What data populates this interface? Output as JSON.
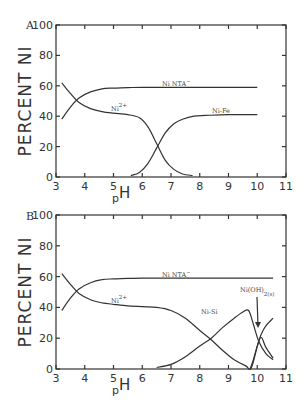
{
  "chart_data": [
    {
      "type": "line",
      "panel": "A",
      "title": "",
      "xlabel": "pH",
      "ylabel": "PERCENT NI",
      "xlim": [
        3,
        11
      ],
      "ylim": [
        0,
        100
      ],
      "xticks": [
        "3",
        "4",
        "5",
        "6",
        "7",
        "8",
        "9",
        "10",
        "11"
      ],
      "yticks": [
        "0",
        "20",
        "40",
        "60",
        "80",
        "100"
      ],
      "grid": false,
      "series": [
        {
          "name": "Ni NTA-",
          "x": [
            3.2,
            3.5,
            3.8,
            4.2,
            4.6,
            5,
            5.5,
            6,
            7,
            8,
            9,
            10
          ],
          "y": [
            38,
            46,
            52,
            56,
            58,
            58.5,
            58.8,
            59,
            59,
            59,
            59,
            59
          ]
        },
        {
          "name": "Ni2+",
          "x": [
            3.2,
            3.5,
            3.8,
            4.2,
            4.6,
            5,
            5.5,
            5.9,
            6.2,
            6.5,
            6.8,
            7.1,
            7.4,
            7.75
          ],
          "y": [
            62,
            55,
            49,
            45,
            43,
            42,
            41,
            39,
            33,
            22,
            11,
            5,
            2,
            1
          ]
        },
        {
          "name": "Ni-Fe",
          "x": [
            5.6,
            5.9,
            6.2,
            6.5,
            6.8,
            7.1,
            7.4,
            7.8,
            8.2,
            9,
            10
          ],
          "y": [
            1,
            3,
            9,
            19,
            29,
            35,
            38,
            40,
            40.5,
            41,
            41
          ]
        }
      ],
      "annotations": [
        {
          "text": "Ni NTA",
          "superscript": "-",
          "x": 7.2,
          "y": 62
        },
        {
          "text": "Ni",
          "superscript": "2+",
          "x": 5.0,
          "y": 43
        },
        {
          "text": "Ni-Fe",
          "x": 8.6,
          "y": 43
        }
      ]
    },
    {
      "type": "line",
      "panel": "B",
      "title": "",
      "xlabel": "pH",
      "ylabel": "PERCENT NI",
      "xlim": [
        3,
        11
      ],
      "ylim": [
        0,
        100
      ],
      "xticks": [
        "3",
        "4",
        "5",
        "6",
        "7",
        "8",
        "9",
        "10",
        "11"
      ],
      "yticks": [
        "0",
        "20",
        "40",
        "60",
        "80",
        "100"
      ],
      "grid": false,
      "series": [
        {
          "name": "Ni NTA-",
          "x": [
            3.2,
            3.5,
            3.8,
            4.2,
            4.6,
            5,
            5.5,
            6,
            7,
            8,
            9,
            10,
            10.55
          ],
          "y": [
            38,
            46,
            52,
            56,
            58,
            58.5,
            58.8,
            59,
            59,
            59,
            59,
            59,
            59
          ]
        },
        {
          "name": "Ni2+",
          "x": [
            3.2,
            3.5,
            3.8,
            4.2,
            4.6,
            5,
            5.5,
            6,
            6.5,
            7,
            7.5,
            8,
            8.4,
            8.8,
            9.2,
            9.6,
            9.8,
            10.1,
            10.3,
            10.55
          ],
          "y": [
            62,
            55,
            49,
            45,
            43,
            42,
            41,
            40.5,
            40,
            38,
            33,
            25,
            19,
            12,
            6,
            2,
            1,
            20,
            14,
            7
          ]
        },
        {
          "name": "Ni-Si",
          "x": [
            6.5,
            7,
            7.5,
            8,
            8.4,
            8.8,
            9.2,
            9.5,
            9.7,
            9.85,
            10.05,
            10.3,
            10.55
          ],
          "y": [
            1,
            3,
            8,
            15,
            20,
            27,
            33,
            37,
            38,
            30,
            18,
            10,
            6
          ]
        },
        {
          "name": "Ni(OH)2(s)",
          "x": [
            9.75,
            9.85,
            10.0,
            10.15,
            10.3,
            10.55
          ],
          "y": [
            0,
            5,
            15,
            23,
            28,
            33
          ]
        }
      ],
      "annotations": [
        {
          "text": "Ni NTA",
          "superscript": "-",
          "x": 7.2,
          "y": 62
        },
        {
          "text": "Ni",
          "superscript": "2+",
          "x": 5.0,
          "y": 42
        },
        {
          "text": "Ni-Si",
          "x": 8.3,
          "y": 37
        },
        {
          "text": "Ni(OH)",
          "subscript": "2(s)",
          "x": 9.8,
          "y": 50,
          "arrow_to": {
            "x": 10.2,
            "y": 26
          }
        }
      ]
    }
  ],
  "labels": {
    "panel_a": "A",
    "panel_b": "B",
    "ylabel": "PERCENT NI",
    "xlabel_p": "p",
    "xlabel_h": "H",
    "nta": "Ni NTA",
    "nta_sup": "−",
    "ni": "Ni",
    "ni_sup": "2+",
    "nife": "Ni-Fe",
    "nisi": "Ni-Si",
    "nioh": "Ni(OH)",
    "nioh_sub": "2(s)"
  }
}
